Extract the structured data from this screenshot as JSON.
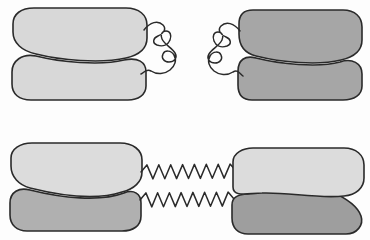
{
  "figure": {
    "width": 370,
    "height": 240,
    "background_color": "#fdfdfd",
    "outline_color": "#2a2a2a",
    "outline_width": 1.6,
    "palette": {
      "light_gray": "#d8d8d8",
      "light_gray_alt": "#dcdcdc",
      "mid_gray": "#b0b0b0",
      "dark_gray": "#a6a6a6",
      "darker_gray": "#9e9e9e",
      "stroke": "#2a2a2a",
      "background": "#fdfdfd"
    },
    "rows": [
      {
        "row_name": "relaxed-state-row",
        "row_index": 0,
        "linker_style": "coiled-slack-zigzag",
        "linkers_connected": false,
        "gap_description": "two coiled tails face each other across an open gap"
      },
      {
        "row_name": "stretched-state-row",
        "row_index": 1,
        "linker_style": "taut-sine-spring",
        "linkers_connected": true,
        "spring_count": 2,
        "spring_cycles": 8
      }
    ],
    "shapes": [
      {
        "shape_name": "top-left-clamp",
        "row": 0,
        "side": "left",
        "upper_lobe_color": "#d8d8d8",
        "lower_lobe_color": "#d8d8d8",
        "style": "rounded",
        "bounds": {
          "x": 12,
          "y": 8,
          "width": 136,
          "height": 92
        }
      },
      {
        "shape_name": "top-right-clamp",
        "row": 0,
        "side": "right",
        "upper_lobe_color": "#a6a6a6",
        "lower_lobe_color": "#a6a6a6",
        "style": "rounded",
        "bounds": {
          "x": 238,
          "y": 10,
          "width": 124,
          "height": 90
        }
      },
      {
        "shape_name": "bottom-left-clamp",
        "row": 1,
        "side": "left",
        "upper_lobe_color": "#dcdcdc",
        "lower_lobe_color": "#b0b0b0",
        "style": "angular",
        "bounds": {
          "x": 10,
          "y": 143,
          "width": 132,
          "height": 88
        }
      },
      {
        "shape_name": "bottom-right-clamp",
        "row": 1,
        "side": "right",
        "upper_lobe_color": "#dcdcdc",
        "lower_lobe_color": "#9e9e9e",
        "style": "angular",
        "bounds": {
          "x": 232,
          "y": 148,
          "width": 132,
          "height": 86
        }
      }
    ],
    "linkers": [
      {
        "linker_name": "top-left-coiled-tail",
        "row": 0,
        "side": "left",
        "type": "slack-zigzag",
        "attach_upper": {
          "x": 144,
          "y": 30
        },
        "attach_lower": {
          "x": 141,
          "y": 74
        }
      },
      {
        "linker_name": "top-right-coiled-tail",
        "row": 0,
        "side": "right",
        "type": "slack-zigzag",
        "attach_upper": {
          "x": 240,
          "y": 31
        },
        "attach_lower": {
          "x": 243,
          "y": 76
        }
      },
      {
        "linker_name": "bottom-upper-spring",
        "row": 1,
        "type": "taut-sine-spring",
        "start": {
          "x": 141,
          "y": 172
        },
        "end": {
          "x": 236,
          "y": 171
        },
        "cycles": 8,
        "amplitude": 7
      },
      {
        "linker_name": "bottom-lower-spring",
        "row": 1,
        "type": "taut-sine-spring",
        "start": {
          "x": 140,
          "y": 200
        },
        "end": {
          "x": 234,
          "y": 199
        },
        "cycles": 8,
        "amplitude": 7
      }
    ]
  }
}
